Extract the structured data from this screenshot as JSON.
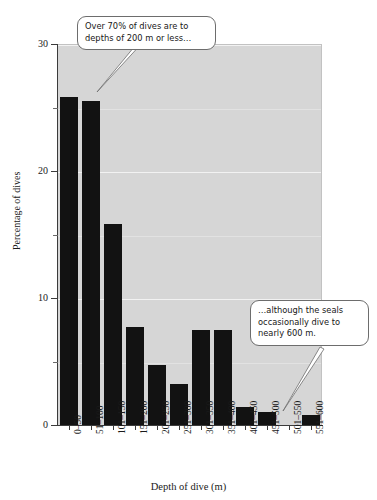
{
  "chart_data": {
    "type": "bar",
    "title": "",
    "xlabel": "Depth of dive (m)",
    "ylabel": "Percentage of dives",
    "categories": [
      "0–50",
      "51–100",
      "101–150",
      "151–200",
      "201–250",
      "251–300",
      "301–350",
      "351–400",
      "401–450",
      "451–500",
      "501–550",
      "551–600"
    ],
    "values": [
      25.8,
      25.5,
      15.8,
      7.7,
      4.7,
      3.2,
      7.5,
      7.5,
      1.4,
      1.0,
      0,
      0.8
    ],
    "ylim": [
      0,
      30
    ],
    "y_ticks_major": [
      "0",
      "10",
      "20",
      "30"
    ],
    "y_tick_major_values": [
      0,
      10,
      20,
      30
    ],
    "y_tick_minor_values": [
      5,
      15,
      25
    ],
    "grid": "horizontal",
    "legend": "none",
    "bar_color": "#121212",
    "plot_background": "#d6d6d6",
    "gridline_color": "#f2f2f2",
    "annotations": [
      {
        "name": "callout-upper-left",
        "line1": "Over 70% of dives are to",
        "line2": "depths of 200 m or less…"
      },
      {
        "name": "callout-lower-right",
        "line1": "…although the seals",
        "line2": "occasionally dive to",
        "line3": "nearly 600 m."
      }
    ]
  }
}
